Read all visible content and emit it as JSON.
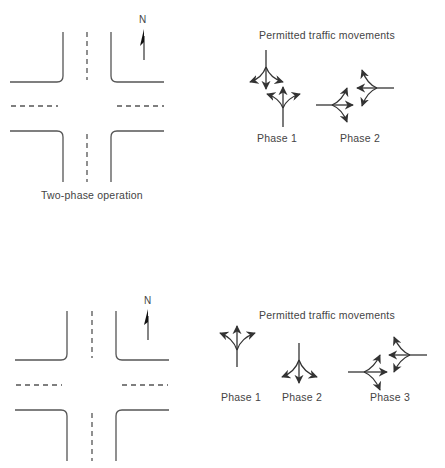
{
  "diagrams": [
    {
      "title": "Two-phase operation",
      "north_label": "N",
      "movements_heading": "Permitted traffic movements",
      "phases": [
        {
          "label": "Phase 1",
          "movements": [
            "southbound: left, through, right",
            "northbound: left, through, right"
          ]
        },
        {
          "label": "Phase 2",
          "movements": [
            "eastbound: left, through, right",
            "westbound: left, through, right"
          ]
        }
      ]
    },
    {
      "title": "",
      "north_label": "N",
      "movements_heading": "Permitted traffic movements",
      "phases": [
        {
          "label": "Phase 1",
          "movements": [
            "northbound: left, through, right"
          ]
        },
        {
          "label": "Phase 2",
          "movements": [
            "southbound: left, through, right"
          ]
        },
        {
          "label": "Phase 3",
          "movements": [
            "eastbound: left, through, right",
            "westbound: left, through, right"
          ]
        }
      ]
    }
  ],
  "colors": {
    "line": "#444444",
    "text": "#444444"
  }
}
